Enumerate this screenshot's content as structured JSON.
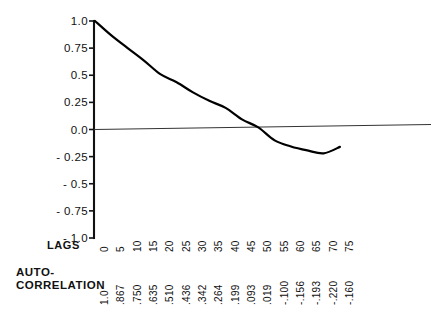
{
  "chart_data": {
    "type": "line",
    "title": "",
    "xlabel": "LAGS",
    "ylabel": "",
    "series_label": "AUTO-CORRELATION",
    "ac_caption_lines": [
      "AUTO-",
      "CORRELATION"
    ],
    "x": [
      0,
      5,
      10,
      15,
      20,
      25,
      30,
      35,
      40,
      45,
      50,
      55,
      60,
      65,
      70,
      75
    ],
    "categories": [
      "0",
      "5",
      "10",
      "15",
      "20",
      "25",
      "30",
      "35",
      "40",
      "45",
      "50",
      "55",
      "60",
      "65",
      "70",
      "75"
    ],
    "values": [
      1.0,
      0.867,
      0.75,
      0.635,
      0.51,
      0.436,
      0.342,
      0.264,
      0.199,
      0.093,
      0.019,
      -0.1,
      -0.156,
      -0.193,
      -0.22,
      -0.16
    ],
    "value_labels": [
      "1.0",
      ".867",
      ".750",
      ".635",
      ".510",
      ".436",
      ".342",
      ".264",
      ".199",
      ".093",
      ".019",
      "-.100",
      "-.156",
      "-.193",
      "-.220",
      "-.160"
    ],
    "ylim": [
      -1.0,
      1.0
    ],
    "xlim": [
      0,
      75
    ],
    "yticks": [
      1.0,
      0.75,
      0.5,
      0.25,
      0.0,
      -0.25,
      -0.5,
      -0.75,
      -1.0
    ],
    "ytick_labels": [
      "1.0",
      "0.75",
      "0.5",
      "0.25",
      "0.0",
      "- 0.25",
      "- 0.5",
      "- 0.75",
      "- 1.0"
    ],
    "grid": false,
    "legend": "none",
    "zero_line": true,
    "line_color": "#000000",
    "axis_color": "#111111",
    "background": "#ffffff"
  }
}
